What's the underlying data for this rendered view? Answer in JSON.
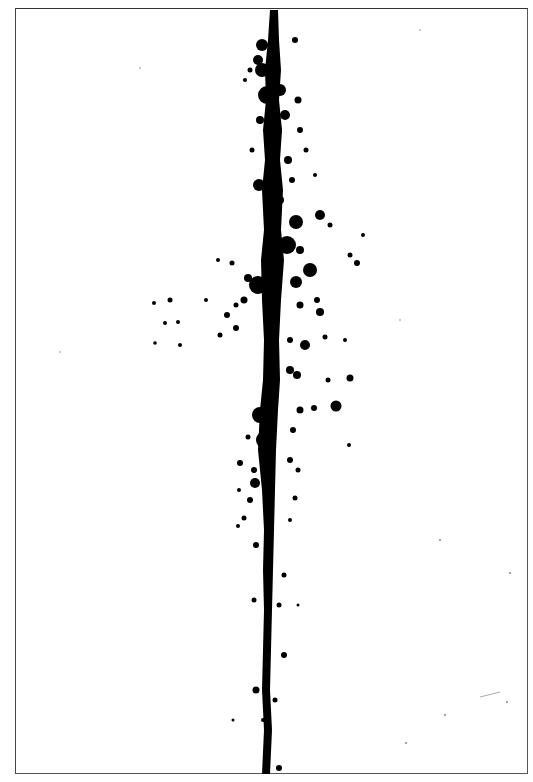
{
  "artwork": {
    "description": "Abstract black ink splatter forming a vertical line down the center of a white framed sheet",
    "ink_color": "#000000",
    "paper_color": "#ffffff",
    "frame_color": "#555555"
  }
}
